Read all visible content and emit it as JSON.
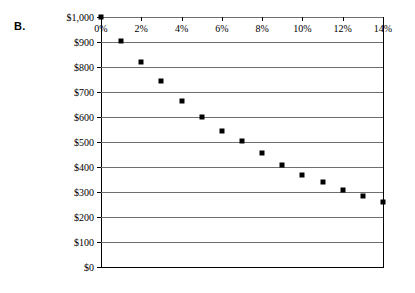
{
  "panel": {
    "label": "B."
  },
  "chart_data": {
    "type": "scatter",
    "title": "",
    "xlabel": "",
    "ylabel": "",
    "x": [
      0,
      1,
      2,
      3,
      4,
      5,
      6,
      7,
      8,
      9,
      10,
      11,
      12,
      13,
      14
    ],
    "values": [
      1000,
      905,
      820,
      745,
      665,
      600,
      545,
      505,
      455,
      410,
      370,
      340,
      310,
      285,
      260
    ],
    "xlim": [
      0,
      14
    ],
    "ylim": [
      0,
      1000
    ],
    "x_tick_values": [
      0,
      2,
      4,
      6,
      8,
      10,
      12,
      14
    ],
    "x_tick_labels": [
      "0%",
      "2%",
      "4%",
      "6%",
      "8%",
      "10%",
      "12%",
      "14%"
    ],
    "y_tick_values": [
      0,
      100,
      200,
      300,
      400,
      500,
      600,
      700,
      800,
      900,
      1000
    ],
    "y_tick_labels": [
      "$0",
      "$100",
      "$200",
      "$300",
      "$400",
      "$500",
      "$600",
      "$700",
      "$800",
      "$900",
      "$1,000"
    ],
    "grid": "horizontal",
    "legend": "none",
    "marker_color": "#000000",
    "gridline_color": "#6e6e6e",
    "axis_color": "#000000"
  }
}
